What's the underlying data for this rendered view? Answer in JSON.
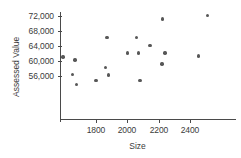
{
  "chart_data": {
    "type": "scatter",
    "title": "",
    "xlabel": "Size",
    "ylabel": "Assessed Value",
    "xlim": [
      1620,
      2560
    ],
    "ylim": [
      53200,
      73600
    ],
    "grid": false,
    "legend": null,
    "xticks": [
      1800,
      2000,
      2200,
      2400
    ],
    "xtick_labels": [
      "1800",
      "2000",
      "2200",
      "2400"
    ],
    "yticks": [
      56000,
      60000,
      64000,
      68000,
      72000
    ],
    "ytick_labels": [
      "56,000",
      "60,000",
      "64,000",
      "68,000",
      "72,000"
    ],
    "point_color": "#575757",
    "axis_color": "#4a4a4a",
    "points": [
      {
        "x": 1590,
        "y": 61100
      },
      {
        "x": 1665,
        "y": 60300
      },
      {
        "x": 1650,
        "y": 56400
      },
      {
        "x": 1675,
        "y": 53800
      },
      {
        "x": 1800,
        "y": 54800
      },
      {
        "x": 1860,
        "y": 58200
      },
      {
        "x": 1870,
        "y": 66300
      },
      {
        "x": 1880,
        "y": 56300
      },
      {
        "x": 2000,
        "y": 62100
      },
      {
        "x": 2060,
        "y": 66300
      },
      {
        "x": 2070,
        "y": 62100
      },
      {
        "x": 2080,
        "y": 54800
      },
      {
        "x": 2145,
        "y": 64200
      },
      {
        "x": 2225,
        "y": 71200
      },
      {
        "x": 2240,
        "y": 62100
      },
      {
        "x": 2220,
        "y": 59200
      },
      {
        "x": 2455,
        "y": 61300
      },
      {
        "x": 2510,
        "y": 72200
      }
    ]
  },
  "axes": {
    "x_title": "Size",
    "y_title": "Assessed Value"
  }
}
